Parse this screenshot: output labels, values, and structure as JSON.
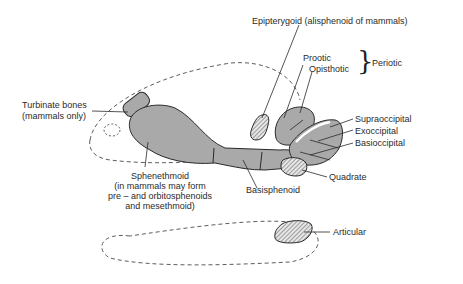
{
  "diagram": {
    "type": "anatomical-skull-bones",
    "colors": {
      "bone_fill": "#a9a9a9",
      "outline": "#2a2a2a",
      "hatch": "#555555",
      "background": "#ffffff"
    },
    "labels": {
      "epipterygoid": "Epipterygoid (alisphenoid of mammals)",
      "prootic": "Prootic",
      "opisthotic": "Opisthotic",
      "periotic": "Periotic",
      "turbinate_1": "Turbinate bones",
      "turbinate_2": "(mammals only)",
      "supraoccipital": "Supraoccipital",
      "exoccipital": "Exoccipital",
      "basioccipital": "Basioccipital",
      "quadrate": "Quadrate",
      "basisphenoid": "Basisphenoid",
      "sphenethmoid_1": "Sphenethmoid",
      "sphenethmoid_2": "(in mammals may form",
      "sphenethmoid_3": "pre – and orbitosphenoids",
      "sphenethmoid_4": "and mesethmoid)",
      "articular": "Articular"
    },
    "bracket": "}"
  }
}
